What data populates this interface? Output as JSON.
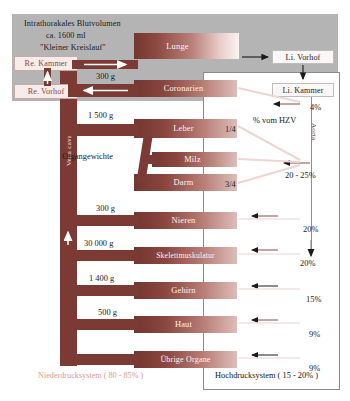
{
  "meta": {
    "colors": {
      "vessel": "#7b3b34",
      "organ_dark": "#733630",
      "organ_light": "#fbf4f3",
      "thorax_panel": "#b4b4b4",
      "low_pressure_text": "#d79b92",
      "high_pressure_text": "#141414"
    }
  },
  "header": {
    "line1": "Intrathorakales Blutvolumen",
    "line2": "ca. 1600 ml",
    "line3": "\"Kleiner Kreislauf\""
  },
  "heart": {
    "right_ventricle": "Re. Kammer",
    "right_atrium": "Re. Vorhof",
    "left_atrium": "Li. Vorhof",
    "left_ventricle": "Li. Kammer"
  },
  "vessels": {
    "vena_cava": "Vena cava",
    "aorta": "Aorta"
  },
  "lung": {
    "label": "Lunge"
  },
  "labels": {
    "organ_weights": "Organgewichte",
    "percent_of_co": "% vom HZV"
  },
  "organs": [
    {
      "name": "Coronarien",
      "weight": "300 g",
      "percent": "4%",
      "fraction": ""
    },
    {
      "name": "Leber",
      "weight": "1 500 g",
      "percent": "20 - 25%",
      "fraction": "1/4"
    },
    {
      "name": "Milz",
      "weight": "",
      "percent": "",
      "fraction": ""
    },
    {
      "name": "Darm",
      "weight": "",
      "percent": "",
      "fraction": "3/4"
    },
    {
      "name": "Nieren",
      "weight": "300 g",
      "percent": "20%",
      "fraction": ""
    },
    {
      "name": "Skelettmuskulatur",
      "weight": "30 000 g",
      "percent": "20%",
      "fraction": ""
    },
    {
      "name": "Gehirn",
      "weight": "1 400 g",
      "percent": "15%",
      "fraction": ""
    },
    {
      "name": "Haut",
      "weight": "500 g",
      "percent": "9%",
      "fraction": ""
    },
    {
      "name": "Übrige Organe",
      "weight": "",
      "percent": "9%",
      "fraction": ""
    }
  ],
  "footer": {
    "low_pressure": "Niederdrucksystem ( 80 - 85% )",
    "high_pressure": "Hochdrucksystem ( 15 - 20% )"
  }
}
